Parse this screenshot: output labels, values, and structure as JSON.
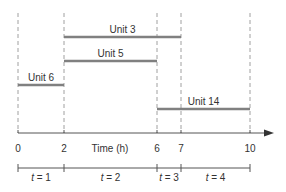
{
  "diagram": {
    "axis_label": "Time (h)",
    "ticks": [
      {
        "value": 0,
        "label": "0",
        "x": 18
      },
      {
        "value": 2,
        "label": "2",
        "x": 64
      },
      {
        "value": 6,
        "label": "6",
        "x": 157
      },
      {
        "value": 7,
        "label": "7",
        "x": 181
      },
      {
        "value": 10,
        "label": "10",
        "x": 250
      }
    ],
    "units": [
      {
        "label": "Unit 3",
        "start": 2,
        "end": 7,
        "y": 37
      },
      {
        "label": "Unit 5",
        "start": 2,
        "end": 6,
        "y": 61
      },
      {
        "label": "Unit 6",
        "start": 0,
        "end": 2,
        "y": 85
      },
      {
        "label": "Unit 14",
        "start": 6,
        "end": 10,
        "y": 109
      }
    ],
    "periods": [
      {
        "label": "t = 1",
        "t": "t",
        "eq": " = 1",
        "start": 0,
        "end": 2
      },
      {
        "label": "t = 2",
        "t": "t",
        "eq": " = 2",
        "start": 2,
        "end": 6
      },
      {
        "label": "t = 3",
        "t": "t",
        "eq": " = 3",
        "start": 6,
        "end": 7
      },
      {
        "label": "t = 4",
        "t": "t",
        "eq": " = 4",
        "start": 7,
        "end": 10
      }
    ],
    "colors": {
      "bar": "#808080",
      "dash": "#a0a0a0",
      "axis": "#555555",
      "text": "#333333"
    }
  }
}
